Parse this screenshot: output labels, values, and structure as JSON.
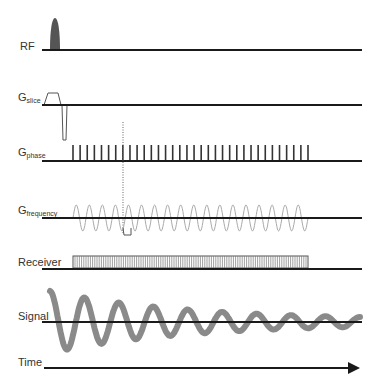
{
  "rows": [
    {
      "id": "rf",
      "label": "RF",
      "sub": "",
      "baseline_y": 50
    },
    {
      "id": "slice",
      "label": "G",
      "sub": "slice",
      "baseline_y": 105
    },
    {
      "id": "phase",
      "label": "G",
      "sub": "phase",
      "baseline_y": 161
    },
    {
      "id": "frequency",
      "label": "G",
      "sub": "frequency",
      "baseline_y": 218
    },
    {
      "id": "receiver",
      "label": "Receiver",
      "sub": "",
      "baseline_y": 268
    },
    {
      "id": "signal",
      "label": "Signal",
      "sub": "",
      "baseline_y": 322
    },
    {
      "id": "time",
      "label": "Time",
      "sub": "",
      "baseline_y": 368
    }
  ],
  "colors": {
    "axis": "#1a1a1a",
    "rf_pulse": "#555555",
    "gradient": "#555555",
    "frequency_wave": "#aaaaaa",
    "signal": "#8a8a8a",
    "label": "#333333"
  },
  "phase_gradient": {
    "start_x": 73,
    "end_x": 308,
    "count": 34
  },
  "receiver_window": {
    "start_x": 73,
    "end_x": 308
  },
  "frequency_gradient": {
    "start_x": 73,
    "end_x": 308,
    "cycles": 18
  },
  "signal_decay": {
    "start_x": 50,
    "end_x": 360,
    "cycles": 9
  }
}
